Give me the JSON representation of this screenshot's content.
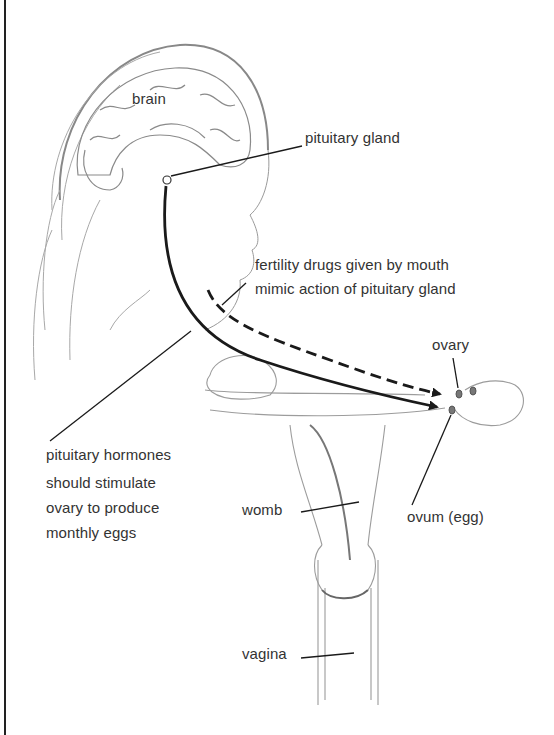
{
  "diagram": {
    "labels": {
      "brain": "brain",
      "pituitary_gland": "pituitary gland",
      "fertility_drugs_line1": "fertility drugs given by mouth",
      "fertility_drugs_line2": "mimic action of pituitary gland",
      "ovary": "ovary",
      "pituitary_hormones_line1": "pituitary hormones",
      "pituitary_hormones_line2": "should stimulate",
      "pituitary_hormones_line3": "ovary to produce",
      "pituitary_hormones_line4": "monthly eggs",
      "womb": "womb",
      "ovum": "ovum (egg)",
      "vagina": "vagina"
    },
    "arrows": [
      {
        "name": "pituitary-hormone-pathway",
        "style": "solid",
        "from": "pituitary gland",
        "to": "ovary"
      },
      {
        "name": "fertility-drug-pathway",
        "style": "dashed",
        "from": "mouth",
        "to": "ovary"
      }
    ],
    "colors": {
      "ink": "#1a1a1a",
      "sketch": "#9a9a9a",
      "text": "#333333"
    }
  }
}
